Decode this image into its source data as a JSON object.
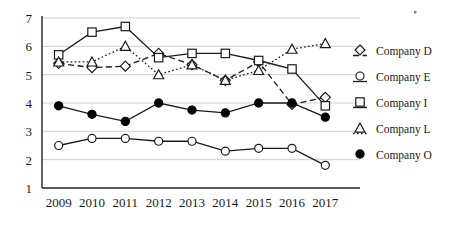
{
  "chart_data": {
    "type": "line",
    "title": "",
    "xlabel": "",
    "ylabel": "",
    "categories": [
      "2009",
      "2010",
      "2011",
      "2012",
      "2013",
      "2014",
      "2015",
      "2016",
      "2017"
    ],
    "ylim": [
      1,
      7
    ],
    "yticks": [
      1,
      2,
      3,
      4,
      5,
      6,
      7
    ],
    "grid": true,
    "legend_position": "right",
    "series": [
      {
        "name": "Company D",
        "marker": "open-diamond",
        "line_style": "dashed",
        "values": [
          5.4,
          5.25,
          5.3,
          5.75,
          5.35,
          4.8,
          5.45,
          3.95,
          4.2
        ]
      },
      {
        "name": "Company E",
        "marker": "open-circle",
        "line_style": "solid",
        "values": [
          2.5,
          2.75,
          2.75,
          2.65,
          2.65,
          2.3,
          2.4,
          2.4,
          1.8
        ]
      },
      {
        "name": "Company I",
        "marker": "open-square",
        "line_style": "solid",
        "values": [
          5.7,
          6.5,
          6.7,
          5.6,
          5.75,
          5.75,
          5.5,
          5.2,
          3.9
        ]
      },
      {
        "name": "Company L",
        "marker": "open-triangle",
        "line_style": "dotted",
        "values": [
          5.45,
          5.45,
          6.0,
          5.0,
          5.35,
          4.8,
          5.15,
          5.9,
          6.1
        ]
      },
      {
        "name": "Company O",
        "marker": "filled-circle",
        "line_style": "solid",
        "values": [
          3.9,
          3.6,
          3.35,
          4.0,
          3.75,
          3.65,
          4.0,
          4.0,
          3.5
        ]
      }
    ]
  },
  "legend": {
    "entries": [
      {
        "label": "Company D"
      },
      {
        "label": "Company E"
      },
      {
        "label": "Company I"
      },
      {
        "label": "Company L"
      },
      {
        "label": "Company O"
      }
    ]
  },
  "colors": {
    "ink": "#1a1a1a",
    "grid": "#c9c9c9",
    "background": "#ffffff"
  }
}
